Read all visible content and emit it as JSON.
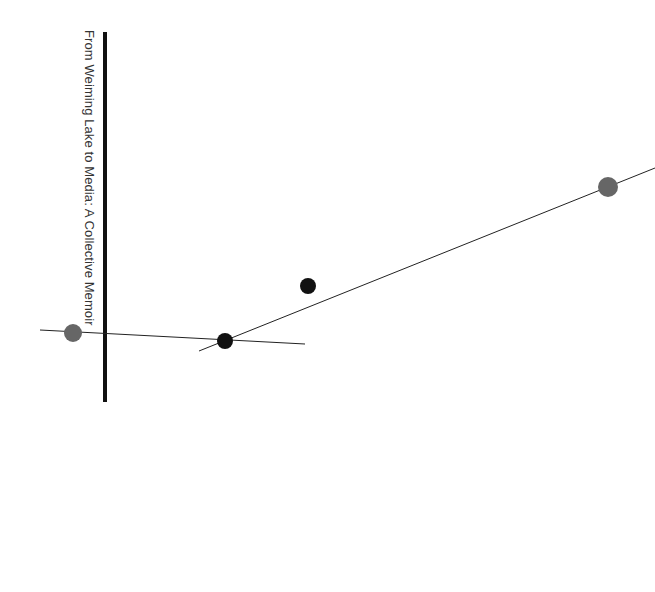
{
  "diagram": {
    "title": "From Weiming Lake to Media: A Collective Memoir",
    "colors": {
      "background": "#ffffff",
      "axis_bar": "#111111",
      "line": "#222222",
      "gray_node": "#666666",
      "black_node": "#111111",
      "title_text": "#333333"
    },
    "axis_bar": {
      "x": 105,
      "y1": 32,
      "y2": 402,
      "width": 4
    },
    "lines": [
      {
        "name": "horizontal-line",
        "x1": 40,
        "y1": 330,
        "x2": 305,
        "y2": 344
      },
      {
        "name": "diagonal-line",
        "x1": 199,
        "y1": 351,
        "x2": 655,
        "y2": 168
      }
    ],
    "nodes": [
      {
        "name": "gray-node-left",
        "cx": 73,
        "cy": 333,
        "r": 9,
        "color": "#666666"
      },
      {
        "name": "black-node-intersection",
        "cx": 225,
        "cy": 341,
        "r": 8,
        "color": "#111111"
      },
      {
        "name": "black-node-upper",
        "cx": 308,
        "cy": 286,
        "r": 8,
        "color": "#111111"
      },
      {
        "name": "gray-node-right",
        "cx": 608,
        "cy": 187,
        "r": 10,
        "color": "#666666"
      }
    ]
  }
}
